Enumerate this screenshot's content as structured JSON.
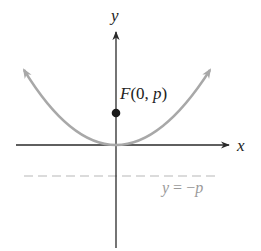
{
  "diagram": {
    "type": "parabola-focus-directrix",
    "axes": {
      "x_label": "x",
      "y_label": "y"
    },
    "focus": {
      "label_letter": "F",
      "label_open": "(0, ",
      "label_p": "p",
      "label_close": ")",
      "full_label": "F(0, p)"
    },
    "directrix": {
      "label_y": "y",
      "label_eq": " = −",
      "label_p": "p",
      "full_label": "y = −p"
    },
    "colors": {
      "axis": "#2a2a2a",
      "parabola": "#a8a8a8",
      "directrix": "#b8b8b8",
      "directrix_label": "#9a9a9a",
      "focus_dot": "#1a1a1a",
      "text": "#222222"
    }
  }
}
